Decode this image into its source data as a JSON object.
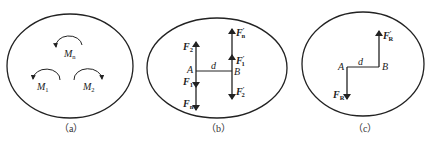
{
  "panels": [
    {
      "caption": "（a）",
      "moments": [
        {
          "name": "M",
          "sub": "n",
          "direction": "counterclockwise"
        },
        {
          "name": "M",
          "sub": "1",
          "direction": "counterclockwise"
        },
        {
          "name": "M",
          "sub": "2",
          "direction": "clockwise"
        }
      ]
    },
    {
      "caption": "（b）",
      "points": [
        "A",
        "B"
      ],
      "distance": "d",
      "forces": {
        "F2": {
          "name": "F",
          "sub": "2"
        },
        "F1": {
          "name": "F",
          "sub": "1"
        },
        "Fn": {
          "name": "F",
          "sub": "n"
        },
        "Fn_prime": {
          "name": "F",
          "sub": "n",
          "prime": "′"
        },
        "F1_prime": {
          "name": "F",
          "sub": "1",
          "prime": "′"
        },
        "F2_prime": {
          "name": "F",
          "sub": "2",
          "prime": "′"
        }
      }
    },
    {
      "caption": "（c）",
      "points": [
        "A",
        "B"
      ],
      "distance": "d",
      "forces": {
        "FR": {
          "name": "F",
          "sub": "R"
        },
        "FR_prime": {
          "name": "F",
          "sub": "R",
          "prime": "′"
        }
      }
    }
  ],
  "colors": {
    "stroke": "#222222",
    "background": "#ffffff"
  }
}
